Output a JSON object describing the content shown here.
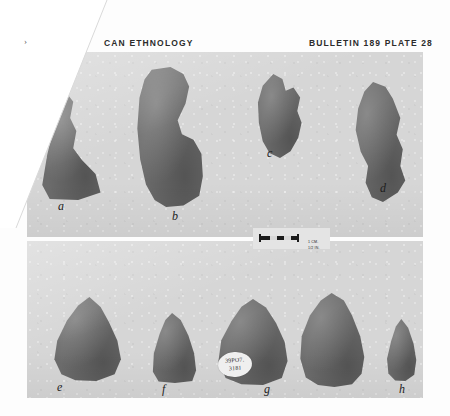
{
  "page": {
    "running_head_left": "CAN ETHNOLOGY",
    "running_head_right": "BULLETIN 189 PLATE 28",
    "corner_mark": "›"
  },
  "plates": [
    {
      "id": "A",
      "letter": "A",
      "specimens": [
        {
          "label": "a"
        },
        {
          "label": "b"
        },
        {
          "label": "c"
        },
        {
          "label": "d"
        }
      ]
    },
    {
      "id": "B",
      "letter": "",
      "specimens": [
        {
          "label": "e"
        },
        {
          "label": "f"
        },
        {
          "label": "g"
        },
        {
          "label": ""
        },
        {
          "label": "h"
        }
      ]
    }
  ],
  "scale_bar": {
    "line_cm": "1 CM.",
    "line_in": "1/2 IN."
  },
  "catalog_tag": {
    "line_1": "39PO7.",
    "line_2": "3181"
  },
  "colors": {
    "paper": "#fdfdfd",
    "plate_background": "#d6d6d6",
    "specimen": "#6c6c6c",
    "text": "#1d1d1d"
  }
}
